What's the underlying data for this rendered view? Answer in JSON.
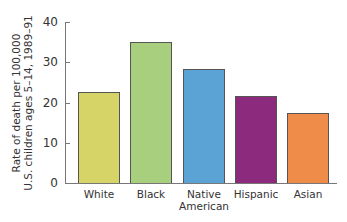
{
  "chart_data": {
    "type": "bar",
    "title": "",
    "xlabel": "",
    "ylabel": "Rate of death per 100,000 U.S. children ages 5–14, 1989–91",
    "ylabel_lines": [
      "Rate of death per 100,000",
      "U.S. children ages 5–14, 1989–91"
    ],
    "categories": [
      "White",
      "Black",
      "Native American",
      "Hispanic",
      "Asian"
    ],
    "category_lines": [
      [
        "White"
      ],
      [
        "Black"
      ],
      [
        "Native",
        "American"
      ],
      [
        "Hispanic"
      ],
      [
        "Asian"
      ]
    ],
    "values": [
      22.5,
      35,
      28.4,
      21.5,
      17.4
    ],
    "colors": [
      "#d6d466",
      "#a8cf7e",
      "#5aa3d4",
      "#8c2a7e",
      "#f08c4a"
    ],
    "ylim": [
      0,
      40
    ],
    "yticks": [
      0,
      10,
      20,
      30,
      40
    ],
    "grid": false,
    "legend": null
  }
}
